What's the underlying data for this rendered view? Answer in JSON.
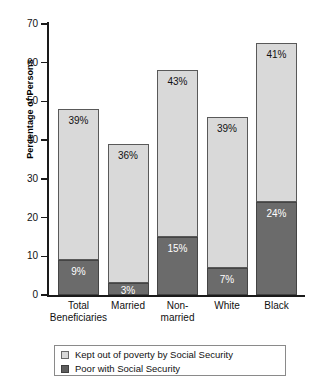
{
  "chart_data": {
    "type": "bar",
    "subtype": "stacked",
    "title": "",
    "xlabel": "",
    "ylabel": "Percentage of Persons",
    "ylim": [
      0,
      70
    ],
    "yticks": [
      0,
      10,
      20,
      30,
      40,
      50,
      60,
      70
    ],
    "ytick_labels": [
      "0",
      "10",
      "20",
      "30",
      "40",
      "50",
      "60",
      "70"
    ],
    "grid": false,
    "legend_position": "bottom",
    "categories": [
      "Total Beneficiaries",
      "Married",
      "Non-married",
      "White",
      "Black"
    ],
    "category_lines": [
      [
        "Total",
        "Beneficiaries"
      ],
      [
        "Married",
        ""
      ],
      [
        "Non-",
        "married"
      ],
      [
        "White",
        ""
      ],
      [
        "Black",
        ""
      ]
    ],
    "series": [
      {
        "name": "Poor with Social Security",
        "color": "#6b6b6b",
        "values": [
          9,
          3,
          15,
          7,
          24
        ],
        "labels": [
          "9%",
          "3%",
          "15%",
          "7%",
          "24%"
        ]
      },
      {
        "name": "Kept out of poverty by Social Security",
        "color": "#d9d9d9",
        "values": [
          39,
          36,
          43,
          39,
          41
        ],
        "labels": [
          "39%",
          "36%",
          "43%",
          "39%",
          "41%"
        ]
      }
    ],
    "totals": [
      48,
      39,
      58,
      46,
      65
    ]
  },
  "legend": {
    "items": [
      {
        "label": "Kept out of poverty by Social Security",
        "swatch": "light"
      },
      {
        "label": "Poor with Social Security",
        "swatch": "dark"
      }
    ]
  },
  "colors": {
    "light_segment": "#d9d9d9",
    "dark_segment": "#6b6b6b",
    "axis": "#1a1a1a",
    "legend_border": "#8a8a8a",
    "background": "#ffffff"
  }
}
